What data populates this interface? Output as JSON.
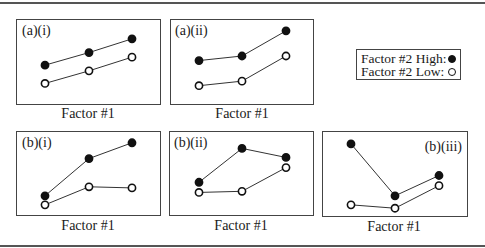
{
  "chart_data": [
    {
      "type": "line",
      "panel": "(a)(i)",
      "xlabel": "Factor #1",
      "x": [
        1,
        2,
        3
      ],
      "series": [
        {
          "name": "Factor #2 High",
          "marker": "filled",
          "values": [
            3.4,
            4.5,
            5.7
          ]
        },
        {
          "name": "Factor #2 Low",
          "marker": "open",
          "values": [
            1.8,
            2.9,
            4.1
          ]
        }
      ],
      "ylim": [
        0,
        7
      ]
    },
    {
      "type": "line",
      "panel": "(a)(ii)",
      "xlabel": "Factor #1",
      "x": [
        1,
        2,
        3
      ],
      "series": [
        {
          "name": "Factor #2 High",
          "marker": "filled",
          "values": [
            3.8,
            4.2,
            6.4
          ]
        },
        {
          "name": "Factor #2 Low",
          "marker": "open",
          "values": [
            1.6,
            2.0,
            4.2
          ]
        }
      ],
      "ylim": [
        0,
        7
      ]
    },
    {
      "type": "line",
      "panel": "(b)(i)",
      "xlabel": "Factor #1",
      "x": [
        1,
        2,
        3
      ],
      "series": [
        {
          "name": "Factor #2 High",
          "marker": "filled",
          "values": [
            1.7,
            5.0,
            6.4
          ]
        },
        {
          "name": "Factor #2 Low",
          "marker": "open",
          "values": [
            0.9,
            2.5,
            2.4
          ]
        }
      ],
      "ylim": [
        0,
        7
      ]
    },
    {
      "type": "line",
      "panel": "(b)(ii)",
      "xlabel": "Factor #1",
      "x": [
        1,
        2,
        3
      ],
      "series": [
        {
          "name": "Factor #2 High",
          "marker": "filled",
          "values": [
            2.9,
            5.9,
            5.1
          ]
        },
        {
          "name": "Factor #2 Low",
          "marker": "open",
          "values": [
            2.0,
            2.1,
            4.2
          ]
        }
      ],
      "ylim": [
        0,
        7
      ]
    },
    {
      "type": "line",
      "panel": "(b)(iii)",
      "xlabel": "Factor #1",
      "x": [
        1,
        2,
        3
      ],
      "series": [
        {
          "name": "Factor #2 High",
          "marker": "filled",
          "values": [
            6.3,
            1.7,
            3.5
          ]
        },
        {
          "name": "Factor #2 Low",
          "marker": "open",
          "values": [
            0.9,
            0.6,
            2.6
          ]
        }
      ],
      "ylim": [
        0,
        7
      ]
    }
  ],
  "legend": {
    "high_label": "Factor #2 High:",
    "low_label": "Factor #2 Low:"
  },
  "panels": {
    "a_i": {
      "label": "(a)(i)",
      "xlabel": "Factor #1"
    },
    "a_ii": {
      "label": "(a)(ii)",
      "xlabel": "Factor #1"
    },
    "b_i": {
      "label": "(b)(i)",
      "xlabel": "Factor #1"
    },
    "b_ii": {
      "label": "(b)(ii)",
      "xlabel": "Factor #1"
    },
    "b_iii": {
      "label": "(b)(iii)",
      "xlabel": "Factor #1"
    }
  },
  "colors": {
    "line": "#333333",
    "marker": "#111111",
    "frame": "#444444"
  }
}
